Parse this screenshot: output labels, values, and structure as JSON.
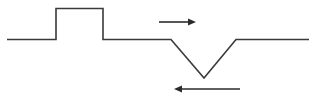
{
  "figure": {
    "background_color": "#ffffff",
    "width": 316,
    "height": 100
  },
  "chart_data": {
    "type": "line",
    "title": "",
    "xlabel": "",
    "ylabel": "",
    "xlim": [
      0,
      316
    ],
    "ylim": [
      100,
      0
    ],
    "grid": false,
    "legend": null,
    "series": [
      {
        "name": "waveform",
        "description": "Horizontal baseline with an upward rectangular pulse followed by a downward V-shaped dip",
        "stroke_color": "#3a3a3a",
        "stroke_width": 1.6,
        "points": [
          [
            7,
            39.5
          ],
          [
            56,
            39.5
          ],
          [
            56,
            8.5
          ],
          [
            103,
            8.5
          ],
          [
            103,
            39.5
          ],
          [
            171,
            39.5
          ],
          [
            204,
            78.0
          ],
          [
            236,
            39.5
          ],
          [
            309,
            39.5
          ]
        ]
      }
    ],
    "annotations": [
      {
        "name": "top-arrow",
        "label": "",
        "direction": "right",
        "x1": 159,
        "y1": 22,
        "x2": 196,
        "y2": 22,
        "color": "#2b2b2b",
        "line_width": 1.6,
        "head_length": 8,
        "head_width": 7
      },
      {
        "name": "bottom-arrow",
        "label": "",
        "direction": "left",
        "x1": 240,
        "y1": 89,
        "x2": 174,
        "y2": 89,
        "color": "#2b2b2b",
        "line_width": 1.6,
        "head_length": 8,
        "head_width": 7
      }
    ]
  }
}
